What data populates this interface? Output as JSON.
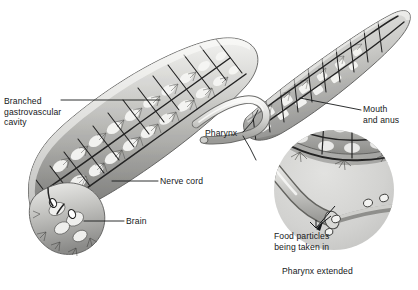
{
  "figure": {
    "background_color": "#ffffff",
    "ink_color": "#16181a"
  },
  "labels": {
    "branched_gastrovascular": "Branched\ngastrovascular\ncavity",
    "nerve_cord": "Nerve cord",
    "brain": "Brain",
    "pharynx": "Pharynx",
    "mouth_and_anus": "Mouth\nand anus",
    "food_particles": "Food particles\nbeing taken in",
    "inset_caption": "Pharynx extended"
  },
  "inset": {
    "shape": "circle",
    "center_x": 334,
    "center_y": 190,
    "radius": 60
  },
  "palette": {
    "body_light": "#e9e9e7",
    "body_mid": "#bdbdba",
    "body_dark": "#8d8d8b",
    "body_shadow": "#6d6d6b",
    "nerve_line": "#2c2c2c",
    "cavity_fill": "#f4f4f2",
    "inset_fill": "#d7d7d5",
    "leader_line": "#16181a"
  }
}
